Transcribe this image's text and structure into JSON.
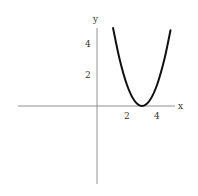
{
  "chart_data": {
    "type": "line",
    "title": "",
    "xlabel": "x",
    "ylabel": "y",
    "xlim": [
      -5.2,
      5.2
    ],
    "ylim": [
      -5.2,
      5.2
    ],
    "x_ticks": [
      "2",
      "4"
    ],
    "y_ticks": [
      "2",
      "4"
    ],
    "grid": false,
    "series": [
      {
        "name": "curve",
        "x": [
          1.07,
          1.5,
          2.0,
          2.5,
          3.0,
          3.5,
          4.0,
          4.5,
          4.9
        ],
        "y": [
          5.2,
          3.15,
          1.4,
          0.35,
          0.0,
          0.35,
          1.4,
          3.15,
          5.05
        ]
      }
    ]
  }
}
